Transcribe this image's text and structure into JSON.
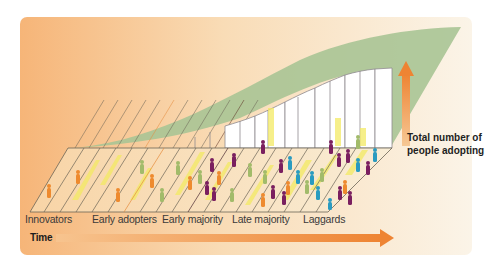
{
  "diagram": {
    "colors": {
      "card_left": "#f6b578",
      "card_right": "#fbf3e6",
      "curve_green": "#a9c495",
      "arrow_orange": "#ef8a3a",
      "grid_line": "#6b6456",
      "bar_white": "#ffffff",
      "figure_orange": "#ee8a2e",
      "figure_green": "#a2bb6a",
      "figure_purple": "#7a1f5f",
      "figure_teal": "#2a9bc0",
      "highlight_yellow": "#f3ea63"
    },
    "categories": [
      {
        "label": "Innovators"
      },
      {
        "label": "Early adopters"
      },
      {
        "label": "Early majority"
      },
      {
        "label": "Late majority"
      },
      {
        "label": "Laggards"
      }
    ],
    "x_axis": {
      "label": "Time"
    },
    "y_axis": {
      "label_line1": "Total number of",
      "label_line2": "people adopting"
    }
  }
}
